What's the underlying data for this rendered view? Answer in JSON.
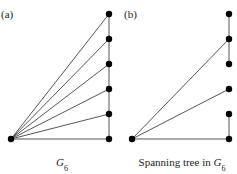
{
  "panels": [
    {
      "id": "a",
      "label": "(a)",
      "caption_main": "G",
      "caption_sub": "6",
      "caption_prefix": "",
      "nodes": [
        "hub",
        "r1",
        "r2",
        "r3",
        "r4",
        "r5",
        "r6"
      ],
      "edges": [
        [
          "hub",
          "r1"
        ],
        [
          "hub",
          "r2"
        ],
        [
          "hub",
          "r3"
        ],
        [
          "hub",
          "r4"
        ],
        [
          "hub",
          "r5"
        ],
        [
          "hub",
          "r6"
        ],
        [
          "r1",
          "r2"
        ],
        [
          "r2",
          "r3"
        ],
        [
          "r3",
          "r4"
        ],
        [
          "r4",
          "r5"
        ],
        [
          "r5",
          "r6"
        ]
      ]
    },
    {
      "id": "b",
      "label": "(b)",
      "caption_prefix": "Spanning tree in ",
      "caption_main": "G",
      "caption_sub": "6",
      "nodes": [
        "hub",
        "r1",
        "r2",
        "r3",
        "r4",
        "r5",
        "r6"
      ],
      "edges": [
        [
          "hub",
          "r2"
        ],
        [
          "hub",
          "r4"
        ],
        [
          "hub",
          "r6"
        ],
        [
          "r1",
          "r2"
        ],
        [
          "r2",
          "r3"
        ],
        [
          "r5",
          "r6"
        ]
      ]
    }
  ]
}
